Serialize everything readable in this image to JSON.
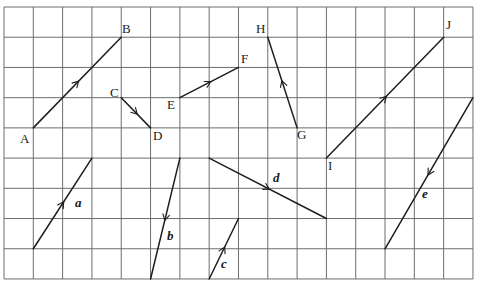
{
  "diagram": {
    "title": "",
    "grid": {
      "columns": 16,
      "rows": 9,
      "origin_px": [
        4,
        7
      ],
      "cell_w": 29.31,
      "cell_h": 30.22,
      "line_color": "#6d6d6d"
    },
    "line_color": "#1e1e1e",
    "segments": [
      {
        "id": "AB",
        "from": {
          "label": "A",
          "col": 1,
          "row": 4
        },
        "to": {
          "label": "B",
          "col": 4,
          "row": 1
        },
        "arrow_dir": "to"
      },
      {
        "id": "CD",
        "from": {
          "label": "C",
          "col": 4,
          "row": 3
        },
        "to": {
          "label": "D",
          "col": 5,
          "row": 4
        },
        "arrow_dir": "to"
      },
      {
        "id": "EF",
        "from": {
          "label": "E",
          "col": 6,
          "row": 3
        },
        "to": {
          "label": "F",
          "col": 8,
          "row": 2
        },
        "arrow_dir": "to"
      },
      {
        "id": "GH",
        "from": {
          "label": "G",
          "col": 10,
          "row": 4
        },
        "to": {
          "label": "H",
          "col": 9,
          "row": 1
        },
        "arrow_dir": "to"
      },
      {
        "id": "IJ",
        "from": {
          "label": "I",
          "col": 11,
          "row": 5
        },
        "to": {
          "label": "J",
          "col": 15,
          "row": 1
        },
        "arrow_dir": "to"
      },
      {
        "id": "a",
        "from": {
          "col": 1,
          "row": 8
        },
        "to": {
          "col": 3,
          "row": 5
        },
        "arrow_dir": "to",
        "name": "a"
      },
      {
        "id": "b",
        "from": {
          "col": 6,
          "row": 5
        },
        "to": {
          "col": 5,
          "row": 9
        },
        "arrow_dir": "to",
        "name": "b"
      },
      {
        "id": "c",
        "from": {
          "col": 7,
          "row": 9
        },
        "to": {
          "col": 8,
          "row": 7
        },
        "arrow_dir": "to",
        "name": "c"
      },
      {
        "id": "d",
        "from": {
          "col": 7,
          "row": 5
        },
        "to": {
          "col": 11,
          "row": 7
        },
        "arrow_dir": "to",
        "name": "d"
      },
      {
        "id": "e",
        "from": {
          "col": 16,
          "row": 3
        },
        "to": {
          "col": 13,
          "row": 8
        },
        "arrow_dir": "to",
        "name": "e"
      }
    ],
    "point_labels": {
      "A": "A",
      "B": "B",
      "C": "C",
      "D": "D",
      "E": "E",
      "F": "F",
      "G": "G",
      "H": "H",
      "I": "I",
      "J": "J"
    },
    "vector_labels": {
      "a": "a",
      "b": "b",
      "c": "c",
      "d": "d",
      "e": "e"
    }
  }
}
